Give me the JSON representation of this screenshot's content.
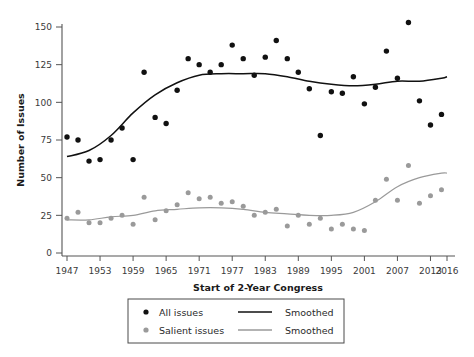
{
  "chart_data": {
    "type": "scatter",
    "title": "",
    "xlabel": "Start of 2-Year Congress",
    "ylabel": "Number of Issues",
    "xlim": [
      1946,
      2017
    ],
    "ylim": [
      0,
      158
    ],
    "grid": false,
    "xticks": [
      1947,
      1953,
      1959,
      1965,
      1971,
      1977,
      1983,
      1989,
      1995,
      2001,
      2007,
      2013,
      2016
    ],
    "xticklabels": [
      "1947",
      "1953",
      "1959",
      "1965",
      "1971",
      "1977",
      "1983",
      "1989",
      "1995",
      "2001",
      "2007",
      "2013",
      "2016"
    ],
    "yticks": [
      0,
      25,
      50,
      75,
      100,
      125,
      150
    ],
    "yticklabels": [
      "0",
      "25",
      "50",
      "75",
      "100",
      "125",
      "150"
    ],
    "legend_position": "below-axes",
    "series": [
      {
        "name": "All issues",
        "kind": "scatter",
        "color": "#111111",
        "x": [
          1947,
          1949,
          1951,
          1953,
          1955,
          1957,
          1959,
          1961,
          1963,
          1965,
          1967,
          1969,
          1971,
          1973,
          1975,
          1977,
          1979,
          1981,
          1983,
          1985,
          1987,
          1989,
          1991,
          1993,
          1995,
          1997,
          1999,
          2001,
          2003,
          2005,
          2007,
          2009,
          2011,
          2013,
          2015
        ],
        "values": [
          77,
          75,
          61,
          62,
          75,
          83,
          62,
          120,
          90,
          86,
          108,
          129,
          125,
          120,
          125,
          138,
          129,
          118,
          130,
          141,
          129,
          120,
          109,
          78,
          107,
          106,
          117,
          99,
          110,
          134,
          116,
          153,
          101,
          85,
          92
        ]
      },
      {
        "name": "Smoothed",
        "kind": "line",
        "color": "#111111",
        "series_for": "All issues",
        "x": [
          1947,
          1951,
          1955,
          1959,
          1963,
          1967,
          1971,
          1975,
          1979,
          1983,
          1987,
          1991,
          1995,
          1999,
          2003,
          2007,
          2011,
          2015,
          2016
        ],
        "values": [
          64,
          68,
          78,
          93,
          105,
          113,
          118,
          119,
          119,
          119,
          117,
          114,
          112,
          111,
          112,
          114,
          114,
          116,
          117
        ]
      },
      {
        "name": "Salient issues",
        "kind": "scatter",
        "color": "#9a9a9a",
        "x": [
          1947,
          1949,
          1951,
          1953,
          1955,
          1957,
          1959,
          1961,
          1963,
          1965,
          1967,
          1969,
          1971,
          1973,
          1975,
          1977,
          1979,
          1981,
          1983,
          1985,
          1987,
          1989,
          1991,
          1993,
          1995,
          1997,
          1999,
          2001,
          2003,
          2005,
          2007,
          2009,
          2011,
          2013,
          2015
        ],
        "values": [
          23,
          27,
          20,
          20,
          23,
          25,
          19,
          37,
          22,
          28,
          32,
          40,
          36,
          37,
          33,
          34,
          31,
          25,
          27,
          29,
          18,
          25,
          19,
          23,
          16,
          19,
          16,
          15,
          35,
          49,
          35,
          58,
          33,
          38,
          42
        ]
      },
      {
        "name": "Smoothed",
        "kind": "line",
        "color": "#9a9a9a",
        "series_for": "Salient issues",
        "x": [
          1947,
          1951,
          1955,
          1959,
          1963,
          1967,
          1971,
          1975,
          1979,
          1983,
          1987,
          1991,
          1995,
          1999,
          2003,
          2007,
          2011,
          2015,
          2016
        ],
        "values": [
          22,
          22,
          24,
          25,
          28,
          29,
          30,
          30,
          29,
          27,
          26,
          25,
          25,
          27,
          34,
          44,
          50,
          53,
          53
        ]
      }
    ]
  },
  "legend": {
    "entries": [
      {
        "marker": "dot-black",
        "label": "All issues"
      },
      {
        "marker": "line-black",
        "label": "Smoothed"
      },
      {
        "marker": "dot-gray",
        "label": "Salient issues"
      },
      {
        "marker": "line-gray",
        "label": "Smoothed"
      }
    ]
  },
  "colors": {
    "all_issues": "#111111",
    "salient_issues": "#9a9a9a",
    "axis": "#555555",
    "text": "#2a2a2a",
    "background": "#ffffff"
  }
}
